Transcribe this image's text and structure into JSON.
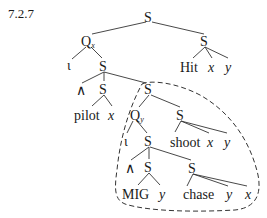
{
  "example_number": "7.2.7",
  "nodes": {
    "root": "S",
    "qx": "Q",
    "qx_sub": "x",
    "hit_s": "S",
    "hit": "Hit",
    "hit_x": "x",
    "hit_y": "y",
    "iota1": "ι",
    "s1": "S",
    "and1": "∧",
    "pilot_s": "S",
    "pilot": "pilot",
    "pilot_x": "x",
    "scope_s": "S",
    "qy": "Q",
    "qy_sub": "y",
    "shoot_s": "S",
    "shoot": "shoot",
    "shoot_x": "x",
    "shoot_y": "y",
    "iota2": "ι",
    "s2": "S",
    "and2": "∧",
    "mig_s": "S",
    "mig": "MIG",
    "mig_y": "y",
    "chase_s": "S",
    "chase": "chase",
    "chase_y": "y",
    "chase_x": "x"
  }
}
